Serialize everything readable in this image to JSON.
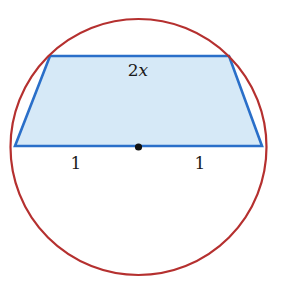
{
  "diagram": {
    "colors": {
      "circle_stroke": "#b5302f",
      "trapezoid_stroke": "#2a6fc9",
      "trapezoid_fill": "#d6e9f7",
      "center_dot": "#111111",
      "label_text": "#1a1a1a"
    },
    "circle": {
      "cx": 138.5,
      "cy": 147,
      "r": 128
    },
    "trapezoid": {
      "vertices": [
        [
          50,
          56
        ],
        [
          229,
          56
        ],
        [
          262,
          146
        ],
        [
          15,
          146
        ]
      ]
    },
    "center_point": {
      "x": 138.5,
      "y": 147
    },
    "labels": {
      "top_side": {
        "number": "2",
        "variable": "x"
      },
      "left_half_base": "1",
      "right_half_base": "1"
    }
  }
}
